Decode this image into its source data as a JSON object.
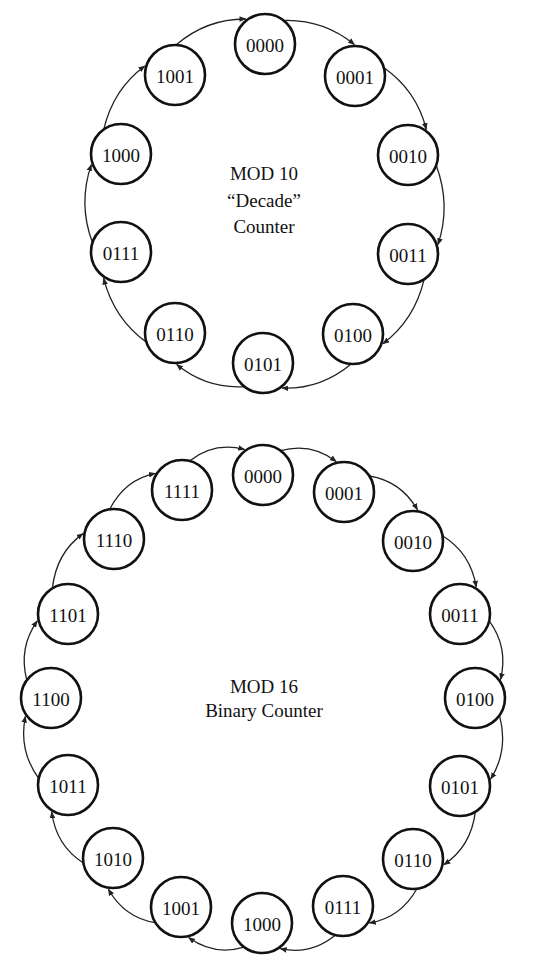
{
  "colors": {
    "stroke": "#111111",
    "edge": "#222222",
    "background": "#ffffff"
  },
  "diagrams": [
    {
      "id": "mod10",
      "title_lines": [
        "MOD 10",
        "“Decade”",
        "Counter"
      ],
      "title_y": [
        180,
        207,
        233
      ],
      "center": [
        264,
        200
      ],
      "node_radius": 30,
      "nodes": [
        {
          "label": "0000",
          "x": 265,
          "y": 44
        },
        {
          "label": "0001",
          "x": 355,
          "y": 76
        },
        {
          "label": "0010",
          "x": 408,
          "y": 155
        },
        {
          "label": "0011",
          "x": 408,
          "y": 254
        },
        {
          "label": "0100",
          "x": 353,
          "y": 334
        },
        {
          "label": "0101",
          "x": 263,
          "y": 363
        },
        {
          "label": "0110",
          "x": 175,
          "y": 333
        },
        {
          "label": "0111",
          "x": 121,
          "y": 252
        },
        {
          "label": "1000",
          "x": 121,
          "y": 154
        },
        {
          "label": "1001",
          "x": 175,
          "y": 75
        }
      ]
    },
    {
      "id": "mod16",
      "title_lines": [
        "MOD 16",
        "Binary Counter"
      ],
      "title_y": [
        693,
        717
      ],
      "center": [
        264,
        699
      ],
      "node_radius": 30,
      "nodes": [
        {
          "label": "0000",
          "x": 263,
          "y": 475
        },
        {
          "label": "0001",
          "x": 344,
          "y": 492
        },
        {
          "label": "0010",
          "x": 413,
          "y": 541
        },
        {
          "label": "0011",
          "x": 460,
          "y": 614
        },
        {
          "label": "0100",
          "x": 475,
          "y": 698
        },
        {
          "label": "0101",
          "x": 460,
          "y": 786
        },
        {
          "label": "0110",
          "x": 413,
          "y": 859
        },
        {
          "label": "0111",
          "x": 343,
          "y": 906
        },
        {
          "label": "1000",
          "x": 262,
          "y": 923
        },
        {
          "label": "1001",
          "x": 181,
          "y": 907
        },
        {
          "label": "1010",
          "x": 113,
          "y": 858
        },
        {
          "label": "1011",
          "x": 68,
          "y": 785
        },
        {
          "label": "1100",
          "x": 51,
          "y": 698
        },
        {
          "label": "1101",
          "x": 68,
          "y": 614
        },
        {
          "label": "1110",
          "x": 114,
          "y": 539
        },
        {
          "label": "1111",
          "x": 182,
          "y": 490
        }
      ]
    }
  ]
}
